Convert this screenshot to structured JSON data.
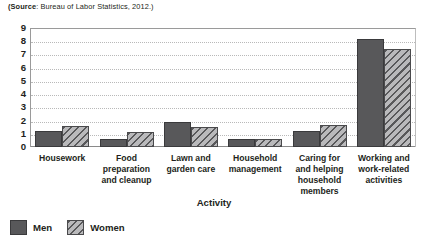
{
  "source": {
    "prefix": "(Source",
    "text": ": Bureau of Labor Statistics, 2012.)",
    "full": "(Source: Bureau of Labor Statistics, 2012.)"
  },
  "legend": {
    "position": "bottom-left",
    "items": [
      {
        "label": "Men",
        "swatch": "solid-dark-gray",
        "color": "#58585a"
      },
      {
        "label": "Women",
        "swatch": "diagonal-hatch-gray",
        "color": "#9d9d9f"
      }
    ]
  },
  "axes": {
    "x_title": "Activity",
    "y_title": "",
    "y_ticks": [
      "0",
      "1",
      "2",
      "3",
      "4",
      "5",
      "6",
      "7",
      "8",
      "9"
    ]
  },
  "chart_data": {
    "type": "bar",
    "title": "",
    "subtitle": "",
    "xlabel": "Activity",
    "ylabel": "",
    "ylim": [
      0,
      9
    ],
    "ytick_step": 1,
    "grid": "horizontal-dotted",
    "legend_position": "bottom-left",
    "categories": [
      "Housework",
      "Food preparation and cleanup",
      "Lawn and garden care",
      "Household management",
      "Caring for and helping household members",
      "Working and work-related activities"
    ],
    "category_label_lines": [
      [
        "Housework"
      ],
      [
        "Food",
        "preparation",
        "and cleanup"
      ],
      [
        "Lawn and",
        "garden care"
      ],
      [
        "Household",
        "management"
      ],
      [
        "Caring for",
        "and helping",
        "household",
        "members"
      ],
      [
        "Working and",
        "work-related",
        "activities"
      ]
    ],
    "series": [
      {
        "name": "Men",
        "color": "#58585a",
        "values": [
          1.2,
          0.6,
          1.9,
          0.6,
          1.2,
          8.2
        ]
      },
      {
        "name": "Women",
        "color": "#9d9d9f",
        "values": [
          1.6,
          1.1,
          1.5,
          0.6,
          1.7,
          7.4
        ]
      }
    ]
  }
}
